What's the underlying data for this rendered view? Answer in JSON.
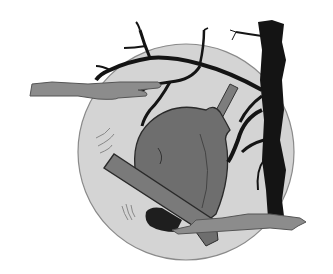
{
  "illustration": {
    "title": "Bell in moonlight with bare tree",
    "elements": {
      "moon": "moon-circle",
      "bell": "bell",
      "clapper": "bell-clapper",
      "tree": "bare-tree",
      "clouds": [
        "cloud-left",
        "cloud-bottom-right"
      ]
    },
    "colors": {
      "background": "#ffffff",
      "moon_fill": "#d4d4d4",
      "moon_stroke": "#8a8a8a",
      "bell_fill": "#6e6e6e",
      "bell_bar_fill": "#7a7a7a",
      "clapper_fill": "#1e1e1e",
      "tree_fill": "#141414",
      "cloud_fill": "#8c8c8c",
      "cloud_stroke": "#555555",
      "yoke_fill": "#7d7d7d"
    }
  }
}
